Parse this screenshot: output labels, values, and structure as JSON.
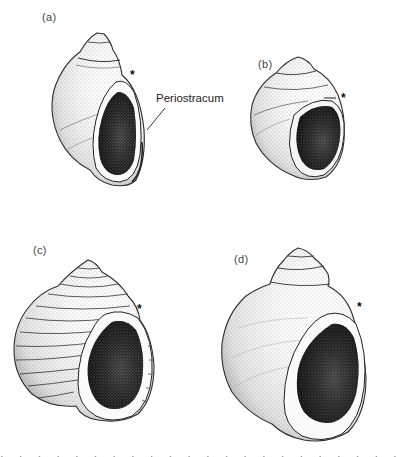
{
  "figure": {
    "panels": [
      {
        "id": "a",
        "label": "(a)",
        "marker": "*"
      },
      {
        "id": "b",
        "label": "(b)",
        "marker": "*"
      },
      {
        "id": "c",
        "label": "(c)",
        "marker": "*"
      },
      {
        "id": "d",
        "label": "(d)",
        "marker": "*"
      }
    ],
    "callout": {
      "panel": "a",
      "text": "Periostracum"
    }
  }
}
